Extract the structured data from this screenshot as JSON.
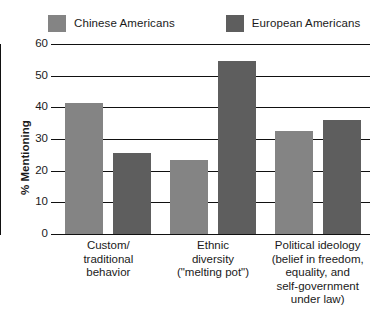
{
  "chart_data": {
    "type": "bar",
    "title": "",
    "subtitle": "",
    "xlabel": "",
    "ylabel": "% Mentioning",
    "ylim": [
      0,
      60
    ],
    "yticks": [
      0,
      10,
      20,
      30,
      40,
      50,
      60
    ],
    "ytick_labels": [
      "0",
      "10",
      "20",
      "30",
      "40",
      "50",
      "60"
    ],
    "grid": true,
    "legend_position": "top-left",
    "categories": [
      "Custom/\ntraditional\nbehavior",
      "Ethnic\ndiversity\n(\"melting pot\")",
      "Political ideology\n(belief in freedom,\nequality, and\nself-government\nunder law)"
    ],
    "series": [
      {
        "name": "Chinese Americans",
        "color": "#848484",
        "values": [
          41.5,
          23.5,
          32.5
        ]
      },
      {
        "name": "European Americans",
        "color": "#5e5e5e",
        "values": [
          25.5,
          54.5,
          36.0
        ]
      }
    ]
  },
  "legend": {
    "entries": [
      {
        "label": "Chinese Americans",
        "color": "#848484"
      },
      {
        "label": "European Americans",
        "color": "#5e5e5e"
      }
    ]
  },
  "axes": {
    "y_title": "% Mentioning",
    "y_ticks": [
      "60",
      "50",
      "40",
      "30",
      "20",
      "10",
      "0"
    ]
  },
  "colors": {
    "series_light": "#848484",
    "series_dark": "#5e5e5e",
    "axis": "#111111",
    "text": "#1a1a1a",
    "background": "#ffffff"
  }
}
